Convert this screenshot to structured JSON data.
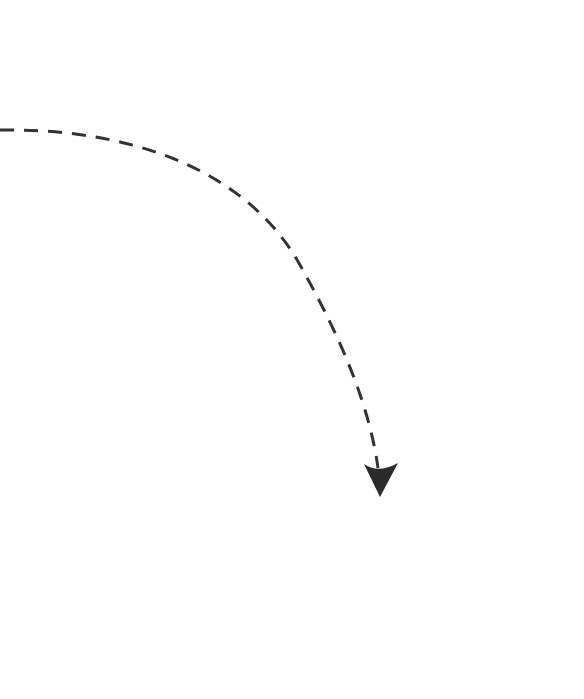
{
  "diagram": {
    "background": "#ffffff",
    "arrow": {
      "style": "dashed",
      "color": "#333333",
      "stroke_width": 3,
      "dash": "14 10",
      "start": [
        0,
        130
      ],
      "end": [
        378,
        472
      ],
      "head_tip": [
        379,
        497
      ],
      "shape": "curved clockwise arc, from left edge heading right then bending down"
    }
  }
}
